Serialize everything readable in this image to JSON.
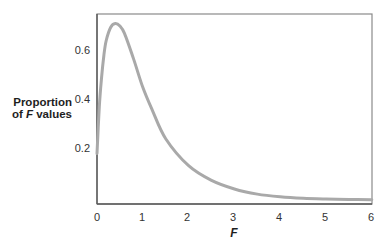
{
  "chart_data": {
    "type": "line",
    "title": "",
    "xlabel": "F",
    "ylabel": "Proportion of F values",
    "ylabel_lines": [
      "Proportion",
      "of",
      "F",
      "values"
    ],
    "xlim": [
      0,
      6
    ],
    "ylim": [
      0,
      0.75
    ],
    "x_ticks": [
      "0",
      "1",
      "2",
      "3",
      "4",
      "5",
      "6"
    ],
    "y_ticks": [
      "0.2",
      "0.4",
      "0.6"
    ],
    "grid": false,
    "legend": null,
    "series": [
      {
        "name": "F distribution density",
        "color": "#a9a9a9",
        "x": [
          0,
          0.05,
          0.1,
          0.15,
          0.2,
          0.3,
          0.4,
          0.5,
          0.6,
          0.8,
          1.0,
          1.2,
          1.5,
          2.0,
          2.5,
          3.0,
          3.5,
          4.0,
          4.5,
          5.0,
          5.5,
          6.0
        ],
        "y": [
          0.19,
          0.38,
          0.5,
          0.59,
          0.65,
          0.705,
          0.72,
          0.71,
          0.68,
          0.575,
          0.46,
          0.37,
          0.25,
          0.14,
          0.08,
          0.045,
          0.024,
          0.013,
          0.007,
          0.004,
          0.002,
          0.001
        ]
      }
    ]
  },
  "axes": {
    "frame_color": "#6e6e6e",
    "curve_color": "#a9a9a9"
  }
}
